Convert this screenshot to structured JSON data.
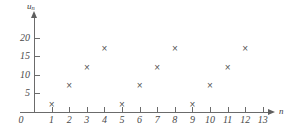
{
  "chart_data": {
    "type": "scatter",
    "title": "",
    "xlabel": "n",
    "ylabel": "u_n",
    "x": [
      1,
      2,
      3,
      4,
      5,
      6,
      7,
      8,
      9,
      10,
      11,
      12
    ],
    "values": [
      2,
      7,
      12,
      17,
      2,
      7,
      12,
      17,
      2,
      7,
      12,
      17
    ],
    "series": [
      {
        "name": "u_n",
        "marker": "cross",
        "values": [
          2,
          7,
          12,
          17,
          2,
          7,
          12,
          17,
          2,
          7,
          12,
          17
        ]
      }
    ],
    "xlim": [
      0,
      13
    ],
    "ylim": [
      0,
      22
    ],
    "xticks": [
      0,
      1,
      2,
      3,
      4,
      5,
      6,
      7,
      8,
      9,
      10,
      11,
      12,
      13
    ],
    "yticks": [
      5,
      10,
      15,
      20
    ],
    "xtick_labels": [
      "0",
      "1",
      "2",
      "3",
      "4",
      "5",
      "6",
      "7",
      "8",
      "9",
      "10",
      "11",
      "12",
      "13"
    ],
    "ytick_labels": [
      "5",
      "10",
      "15",
      "20"
    ],
    "origin_label": "0",
    "grid": false,
    "legend": false,
    "axis_color": "#6b6b6b",
    "marker_color": "#555555",
    "background": "#ffffff"
  },
  "axes": {
    "y_title_main": "u",
    "y_title_sub": "n",
    "x_title": "n"
  },
  "markers": {
    "glyph": "×"
  }
}
